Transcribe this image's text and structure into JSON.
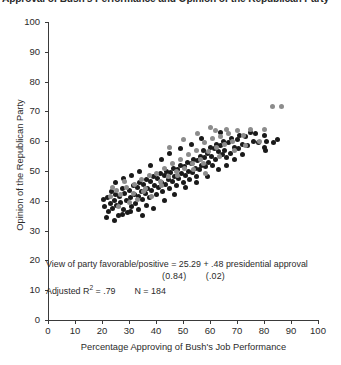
{
  "chart_data": {
    "type": "scatter",
    "title": "Approval of Bush's Performance and Opinion of the Republican Party",
    "xlabel": "Percentage Approving of Bush's Job Performance",
    "ylabel": "Opinion of the Republican Party",
    "xlim": [
      0,
      100
    ],
    "ylim": [
      0,
      100
    ],
    "xticks": [
      "0",
      "10",
      "20",
      "30",
      "40",
      "50",
      "60",
      "70",
      "80",
      "90",
      "100"
    ],
    "yticks": [
      "0",
      "10",
      "20",
      "30",
      "40",
      "50",
      "60",
      "70",
      "80",
      "90",
      "100"
    ],
    "grid": false,
    "legend": "none",
    "series": [
      {
        "name": "dark-points",
        "color": "#1a1a1a",
        "points": [
          [
            20.5,
            40.5
          ],
          [
            21.0,
            38.0
          ],
          [
            22.0,
            41.0
          ],
          [
            22.5,
            36.5
          ],
          [
            23.0,
            39.0
          ],
          [
            23.5,
            43.0
          ],
          [
            24.0,
            37.5
          ],
          [
            24.5,
            40.0
          ],
          [
            25.0,
            42.0
          ],
          [
            25.5,
            38.5
          ],
          [
            26.0,
            35.0
          ],
          [
            26.5,
            41.5
          ],
          [
            27.0,
            39.5
          ],
          [
            27.5,
            44.0
          ],
          [
            28.0,
            37.0
          ],
          [
            28.5,
            42.5
          ],
          [
            29.0,
            40.0
          ],
          [
            29.5,
            36.0
          ],
          [
            30.0,
            43.5
          ],
          [
            30.5,
            41.0
          ],
          [
            31.0,
            38.0
          ],
          [
            31.5,
            45.0
          ],
          [
            32.0,
            42.0
          ],
          [
            32.5,
            39.0
          ],
          [
            33.0,
            44.5
          ],
          [
            33.5,
            41.5
          ],
          [
            34.0,
            46.0
          ],
          [
            34.5,
            43.0
          ],
          [
            35.0,
            40.5
          ],
          [
            35.5,
            45.5
          ],
          [
            36.0,
            42.5
          ],
          [
            36.5,
            47.0
          ],
          [
            37.0,
            44.0
          ],
          [
            37.5,
            41.0
          ],
          [
            38.0,
            46.5
          ],
          [
            38.5,
            43.5
          ],
          [
            39.0,
            48.0
          ],
          [
            39.5,
            45.0
          ],
          [
            40.0,
            42.0
          ],
          [
            40.5,
            47.5
          ],
          [
            41.0,
            44.5
          ],
          [
            41.5,
            49.0
          ],
          [
            42.0,
            46.0
          ],
          [
            42.5,
            43.0
          ],
          [
            43.0,
            48.5
          ],
          [
            43.5,
            45.5
          ],
          [
            44.0,
            50.0
          ],
          [
            44.5,
            47.0
          ],
          [
            45.0,
            44.0
          ],
          [
            45.5,
            49.5
          ],
          [
            46.0,
            46.5
          ],
          [
            46.5,
            51.0
          ],
          [
            47.0,
            48.0
          ],
          [
            47.5,
            45.0
          ],
          [
            48.0,
            50.5
          ],
          [
            48.5,
            47.5
          ],
          [
            49.0,
            52.0
          ],
          [
            49.5,
            49.0
          ],
          [
            50.0,
            46.0
          ],
          [
            50.5,
            51.5
          ],
          [
            51.0,
            48.5
          ],
          [
            51.5,
            53.0
          ],
          [
            52.0,
            50.0
          ],
          [
            52.5,
            47.0
          ],
          [
            53.0,
            52.5
          ],
          [
            53.5,
            49.5
          ],
          [
            54.0,
            54.0
          ],
          [
            54.5,
            51.0
          ],
          [
            55.0,
            48.0
          ],
          [
            55.5,
            53.5
          ],
          [
            56.0,
            50.5
          ],
          [
            56.5,
            55.0
          ],
          [
            57.0,
            52.0
          ],
          [
            57.5,
            57.0
          ],
          [
            58.0,
            54.5
          ],
          [
            58.5,
            51.5
          ],
          [
            59.0,
            56.0
          ],
          [
            59.5,
            53.0
          ],
          [
            60.0,
            58.0
          ],
          [
            60.5,
            55.0
          ],
          [
            61.0,
            52.0
          ],
          [
            61.5,
            57.5
          ],
          [
            62.0,
            54.0
          ],
          [
            62.5,
            59.0
          ],
          [
            63.0,
            56.5
          ],
          [
            64.0,
            58.5
          ],
          [
            64.5,
            55.5
          ],
          [
            65.0,
            60.0
          ],
          [
            65.5,
            57.0
          ],
          [
            66.0,
            54.5
          ],
          [
            67.0,
            59.5
          ],
          [
            67.5,
            56.0
          ],
          [
            68.0,
            61.0
          ],
          [
            69.0,
            58.0
          ],
          [
            70.0,
            60.5
          ],
          [
            70.5,
            57.5
          ],
          [
            71.0,
            62.0
          ],
          [
            72.0,
            59.0
          ],
          [
            73.0,
            61.5
          ],
          [
            74.0,
            58.5
          ],
          [
            75.0,
            63.0
          ],
          [
            76.0,
            60.0
          ],
          [
            77.0,
            62.5
          ],
          [
            78.0,
            59.5
          ],
          [
            80.0,
            62.0
          ],
          [
            80.0,
            58.0
          ],
          [
            80.5,
            57.0
          ],
          [
            81.0,
            60.0
          ],
          [
            83.5,
            59.5
          ],
          [
            85.0,
            60.5
          ],
          [
            21.5,
            34.5
          ],
          [
            24.5,
            33.5
          ],
          [
            27.5,
            35.5
          ],
          [
            30.5,
            36.5
          ],
          [
            33.5,
            37.0
          ],
          [
            36.5,
            38.5
          ],
          [
            25.0,
            46.0
          ],
          [
            28.0,
            47.5
          ],
          [
            31.0,
            48.5
          ],
          [
            34.0,
            50.0
          ],
          [
            38.0,
            52.0
          ],
          [
            42.0,
            54.0
          ],
          [
            45.0,
            56.0
          ],
          [
            49.0,
            57.5
          ],
          [
            53.0,
            59.0
          ],
          [
            57.0,
            61.0
          ],
          [
            35.0,
            35.0
          ],
          [
            39.0,
            37.5
          ],
          [
            43.0,
            40.0
          ],
          [
            47.0,
            42.0
          ],
          [
            51.0,
            44.5
          ],
          [
            55.0,
            46.0
          ],
          [
            59.0,
            48.0
          ],
          [
            63.0,
            50.5
          ],
          [
            66.0,
            52.0
          ],
          [
            69.0,
            54.0
          ],
          [
            72.0,
            55.5
          ],
          [
            64.0,
            63.0
          ]
        ]
      },
      {
        "name": "gray-points",
        "color": "#8c8c8c",
        "points": [
          [
            23.0,
            41.5
          ],
          [
            25.5,
            43.5
          ],
          [
            27.0,
            42.0
          ],
          [
            29.0,
            44.5
          ],
          [
            30.0,
            39.5
          ],
          [
            31.5,
            42.5
          ],
          [
            33.0,
            40.5
          ],
          [
            34.5,
            47.0
          ],
          [
            36.0,
            44.0
          ],
          [
            37.5,
            48.5
          ],
          [
            38.5,
            41.5
          ],
          [
            40.0,
            49.0
          ],
          [
            41.5,
            46.5
          ],
          [
            43.0,
            51.0
          ],
          [
            44.5,
            48.0
          ],
          [
            46.0,
            52.5
          ],
          [
            47.5,
            50.0
          ],
          [
            49.0,
            54.0
          ],
          [
            50.5,
            51.0
          ],
          [
            52.0,
            55.5
          ],
          [
            53.5,
            52.5
          ],
          [
            55.0,
            57.0
          ],
          [
            56.5,
            54.0
          ],
          [
            58.0,
            59.5
          ],
          [
            59.5,
            56.5
          ],
          [
            61.0,
            61.0
          ],
          [
            62.5,
            58.0
          ],
          [
            64.0,
            61.5
          ],
          [
            65.5,
            59.0
          ],
          [
            67.0,
            62.5
          ],
          [
            60.0,
            64.5
          ],
          [
            62.0,
            63.5
          ],
          [
            66.0,
            64.0
          ],
          [
            68.5,
            60.0
          ],
          [
            70.0,
            63.5
          ],
          [
            72.5,
            62.0
          ],
          [
            75.0,
            64.0
          ],
          [
            83.0,
            71.5
          ],
          [
            86.5,
            71.5
          ],
          [
            26.0,
            38.0
          ],
          [
            32.0,
            45.5
          ],
          [
            35.5,
            43.0
          ],
          [
            42.0,
            45.0
          ],
          [
            48.0,
            48.5
          ],
          [
            54.0,
            50.5
          ],
          [
            57.5,
            52.5
          ],
          [
            63.5,
            55.0
          ],
          [
            69.0,
            57.0
          ],
          [
            73.0,
            58.5
          ],
          [
            78.5,
            60.0
          ],
          [
            80.0,
            64.0
          ],
          [
            45.0,
            58.0
          ],
          [
            50.0,
            60.5
          ],
          [
            55.5,
            62.5
          ],
          [
            58.5,
            49.0
          ],
          [
            28.5,
            46.5
          ],
          [
            24.0,
            44.5
          ]
        ]
      }
    ],
    "annotation": {
      "equation": "View of party favorable/positive = 25.29 +  .48 presidential approval",
      "se_left": "(0.84)",
      "se_right": "(.02)",
      "adjusted_r2_label": "Adjusted R",
      "adjusted_r2_sup": "2",
      "adjusted_r2_value": " = .79",
      "n_value": "N = 184"
    }
  }
}
